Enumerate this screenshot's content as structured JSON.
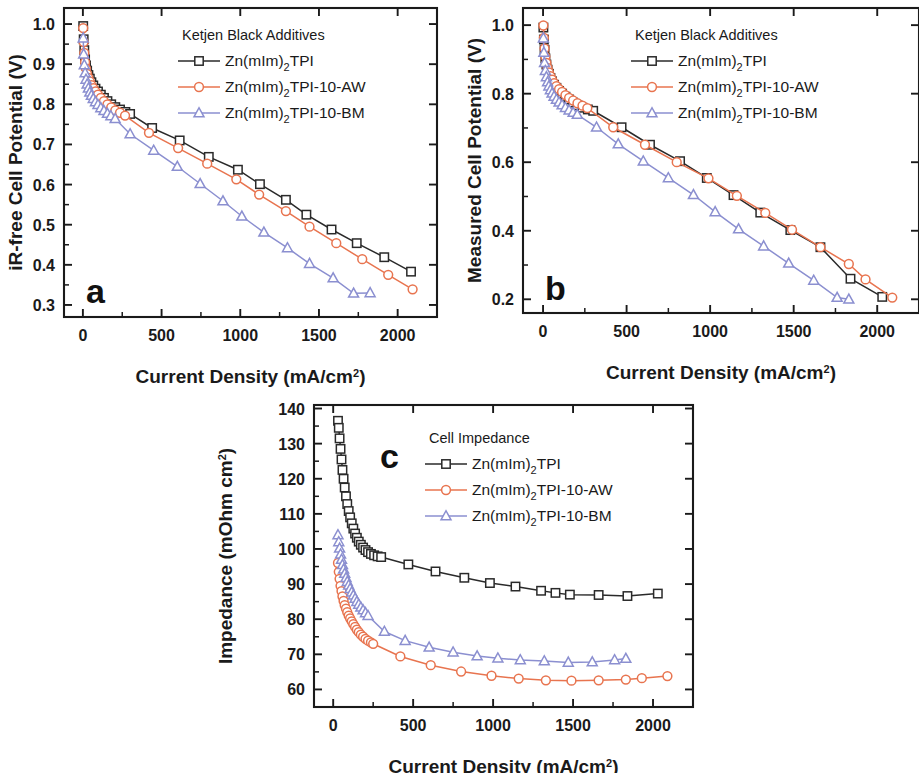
{
  "figure": {
    "panels": [
      "a",
      "b",
      "c"
    ],
    "colors": {
      "series1": "#2a2a2a",
      "series2": "#e8744f",
      "series3": "#8b8fd0",
      "axis": "#1a1a1a"
    }
  },
  "series_names": {
    "s1_pre": "Zn(mIm)",
    "s1_sub": "2",
    "s1_post": "TPI",
    "s2_post": "TPI-10-AW",
    "s3_post": "TPI-10-BM"
  },
  "axis_titles": {
    "current_density_pre": "Current Density (mA/cm",
    "current_density_sup": "2",
    "current_density_post": ")",
    "panel_a_y": "iR-free Cell Potential (V)",
    "panel_b_y": "Measured Cell Potential (V)",
    "panel_c_y_pre": "Impedance (mOhm cm",
    "panel_c_y_sup": "2",
    "panel_c_y_post": ")"
  },
  "legend_titles": {
    "panel_a": "Ketjen Black Additives",
    "panel_b": "Ketjen Black Additives",
    "panel_c": "Cell Impedance"
  },
  "panel_labels": {
    "a": "a",
    "b": "b",
    "c": "c"
  },
  "chart_data": [
    {
      "id": "a",
      "type": "line",
      "title": "",
      "xlabel": "Current Density (mA/cm2)",
      "ylabel": "iR-free Cell Potential (V)",
      "legend_title": "Ketjen Black Additives",
      "legend_position": "top-right",
      "grid": false,
      "xlim": [
        -120,
        2250
      ],
      "ylim": [
        0.27,
        1.04
      ],
      "xticks": [
        0,
        500,
        1000,
        1500,
        2000
      ],
      "yticks": [
        0.3,
        0.4,
        0.5,
        0.6,
        0.7,
        0.8,
        0.9,
        1.0
      ],
      "xticklabels": [
        "0",
        "500",
        "1000",
        "1500",
        "2000"
      ],
      "yticklabels": [
        "0.3",
        "0.4",
        "0.5",
        "0.6",
        "0.7",
        "0.8",
        "0.9",
        "1.0"
      ],
      "series": [
        {
          "name": "Zn(mIm)2TPI",
          "marker": "square",
          "color": "#2a2a2a",
          "x": [
            2,
            5,
            9,
            14,
            20,
            27,
            35,
            44,
            54,
            66,
            80,
            96,
            114,
            134,
            156,
            180,
            206,
            236,
            270,
            300,
            440,
            615,
            800,
            985,
            1125,
            1290,
            1420,
            1580,
            1740,
            1915,
            2085
          ],
          "y": [
            0.995,
            0.962,
            0.935,
            0.912,
            0.897,
            0.884,
            0.873,
            0.864,
            0.855,
            0.847,
            0.839,
            0.832,
            0.824,
            0.816,
            0.808,
            0.8,
            0.793,
            0.787,
            0.781,
            0.776,
            0.741,
            0.71,
            0.669,
            0.637,
            0.601,
            0.562,
            0.525,
            0.488,
            0.454,
            0.419,
            0.383
          ]
        },
        {
          "name": "Zn(mIm)2TPI-10-AW",
          "marker": "circle",
          "color": "#e8744f",
          "x": [
            2,
            5,
            9,
            14,
            20,
            27,
            35,
            44,
            54,
            66,
            80,
            96,
            114,
            134,
            156,
            180,
            206,
            236,
            268,
            420,
            605,
            790,
            975,
            1120,
            1290,
            1440,
            1610,
            1775,
            1940,
            2095
          ],
          "y": [
            0.99,
            0.955,
            0.928,
            0.905,
            0.889,
            0.876,
            0.866,
            0.857,
            0.848,
            0.84,
            0.832,
            0.824,
            0.816,
            0.808,
            0.8,
            0.792,
            0.785,
            0.779,
            0.772,
            0.729,
            0.691,
            0.652,
            0.613,
            0.575,
            0.534,
            0.495,
            0.454,
            0.414,
            0.375,
            0.339
          ]
        },
        {
          "name": "Zn(mIm)2TPI-10-BM",
          "marker": "triangle",
          "color": "#8b8fd0",
          "x": [
            2,
            5,
            9,
            14,
            20,
            27,
            35,
            44,
            54,
            66,
            80,
            96,
            114,
            134,
            156,
            178,
            205,
            300,
            450,
            600,
            745,
            890,
            1010,
            1150,
            1300,
            1440,
            1590,
            1720,
            1825
          ],
          "y": [
            0.965,
            0.925,
            0.898,
            0.878,
            0.862,
            0.85,
            0.84,
            0.83,
            0.822,
            0.814,
            0.806,
            0.799,
            0.791,
            0.784,
            0.777,
            0.771,
            0.764,
            0.726,
            0.685,
            0.645,
            0.602,
            0.559,
            0.521,
            0.481,
            0.442,
            0.403,
            0.367,
            0.329,
            0.33
          ]
        }
      ]
    },
    {
      "id": "b",
      "type": "line",
      "title": "",
      "xlabel": "Current Density (mA/cm2)",
      "ylabel": "Measured Cell Potential (V)",
      "legend_title": "Ketjen Black Additives",
      "legend_position": "top-right",
      "grid": false,
      "xlim": [
        -120,
        2250
      ],
      "ylim": [
        0.16,
        1.05
      ],
      "xticks": [
        0,
        500,
        1000,
        1500,
        2000
      ],
      "yticks": [
        0.2,
        0.4,
        0.6,
        0.8,
        1.0
      ],
      "xticklabels": [
        "0",
        "500",
        "1000",
        "1500",
        "2000"
      ],
      "yticklabels": [
        "0.2",
        "0.4",
        "0.6",
        "0.8",
        "1.0"
      ],
      "series": [
        {
          "name": "Zn(mIm)2TPI",
          "marker": "square",
          "color": "#2a2a2a",
          "x": [
            2,
            5,
            9,
            14,
            20,
            27,
            35,
            44,
            54,
            66,
            80,
            96,
            114,
            134,
            156,
            180,
            206,
            236,
            268,
            300,
            470,
            640,
            820,
            980,
            1140,
            1300,
            1480,
            1660,
            1840,
            2030
          ],
          "y": [
            0.993,
            0.958,
            0.928,
            0.903,
            0.885,
            0.87,
            0.858,
            0.846,
            0.836,
            0.826,
            0.817,
            0.808,
            0.8,
            0.791,
            0.783,
            0.774,
            0.766,
            0.759,
            0.754,
            0.75,
            0.702,
            0.651,
            0.603,
            0.554,
            0.504,
            0.453,
            0.402,
            0.352,
            0.26,
            0.207
          ]
        },
        {
          "name": "Zn(mIm)2TPI-10-AW",
          "marker": "circle",
          "color": "#e8744f",
          "x": [
            2,
            5,
            9,
            14,
            20,
            27,
            35,
            44,
            54,
            66,
            80,
            96,
            114,
            134,
            156,
            180,
            206,
            236,
            265,
            420,
            610,
            800,
            990,
            1160,
            1330,
            1490,
            1660,
            1830,
            1930,
            2090
          ],
          "y": [
            0.999,
            0.963,
            0.932,
            0.908,
            0.89,
            0.875,
            0.862,
            0.851,
            0.841,
            0.831,
            0.822,
            0.813,
            0.805,
            0.796,
            0.788,
            0.78,
            0.772,
            0.765,
            0.758,
            0.702,
            0.651,
            0.6,
            0.553,
            0.502,
            0.452,
            0.403,
            0.352,
            0.303,
            0.258,
            0.205
          ]
        },
        {
          "name": "Zn(mIm)2TPI-10-BM",
          "marker": "triangle",
          "color": "#8b8fd0",
          "x": [
            2,
            5,
            9,
            14,
            20,
            27,
            35,
            44,
            54,
            66,
            80,
            96,
            114,
            134,
            156,
            180,
            205,
            320,
            450,
            600,
            750,
            900,
            1030,
            1170,
            1320,
            1470,
            1620,
            1760,
            1830
          ],
          "y": [
            0.962,
            0.92,
            0.89,
            0.867,
            0.849,
            0.834,
            0.822,
            0.811,
            0.801,
            0.792,
            0.783,
            0.775,
            0.767,
            0.759,
            0.752,
            0.745,
            0.739,
            0.702,
            0.653,
            0.603,
            0.554,
            0.505,
            0.455,
            0.405,
            0.355,
            0.305,
            0.255,
            0.205,
            0.2
          ]
        }
      ]
    },
    {
      "id": "c",
      "type": "line",
      "title": "",
      "xlabel": "Current Density (mA/cm2)",
      "ylabel": "Impedance (mOhm cm2)",
      "legend_title": "Cell Impedance",
      "legend_position": "top-right",
      "grid": false,
      "xlim": [
        -120,
        2250
      ],
      "ylim": [
        55,
        141
      ],
      "xticks": [
        0,
        500,
        1000,
        1500,
        2000
      ],
      "yticks": [
        60,
        70,
        80,
        90,
        100,
        110,
        120,
        130,
        140
      ],
      "xticklabels": [
        "0",
        "500",
        "1000",
        "1500",
        "2000"
      ],
      "yticklabels": [
        "60",
        "70",
        "80",
        "90",
        "100",
        "110",
        "120",
        "130",
        "140"
      ],
      "series": [
        {
          "name": "Zn(mIm)2TPI",
          "marker": "square",
          "color": "#2a2a2a",
          "x": [
            30,
            35,
            40,
            46,
            52,
            58,
            65,
            72,
            80,
            88,
            97,
            106,
            116,
            126,
            137,
            148,
            160,
            173,
            187,
            202,
            218,
            236,
            256,
            278,
            300,
            470,
            640,
            820,
            980,
            1140,
            1300,
            1390,
            1480,
            1660,
            1840,
            2030
          ],
          "y": [
            136.5,
            134.5,
            131.5,
            128.5,
            125.5,
            122.5,
            120.0,
            117.5,
            115.0,
            112.8,
            110.8,
            109.0,
            107.3,
            105.8,
            104.4,
            103.2,
            102.1,
            101.2,
            100.4,
            99.7,
            99.1,
            98.6,
            98.2,
            97.9,
            97.7,
            95.6,
            93.6,
            91.8,
            90.3,
            89.3,
            88.1,
            87.5,
            87.0,
            86.9,
            86.6,
            87.3
          ]
        },
        {
          "name": "Zn(mIm)2TPI-10-AW",
          "marker": "circle",
          "color": "#e8744f",
          "x": [
            30,
            35,
            40,
            46,
            52,
            58,
            65,
            72,
            80,
            88,
            97,
            106,
            116,
            126,
            137,
            148,
            160,
            173,
            187,
            202,
            218,
            236,
            250,
            420,
            610,
            800,
            990,
            1160,
            1330,
            1490,
            1660,
            1830,
            1930,
            2090
          ],
          "y": [
            96.0,
            93.5,
            91.5,
            89.5,
            88.0,
            86.5,
            85.2,
            84.0,
            83.0,
            82.0,
            81.0,
            80.2,
            79.4,
            78.6,
            77.8,
            77.0,
            76.3,
            75.6,
            75.0,
            74.4,
            73.9,
            73.4,
            73.0,
            69.4,
            66.9,
            65.1,
            63.9,
            63.1,
            62.6,
            62.5,
            62.6,
            62.8,
            63.2,
            63.8
          ]
        },
        {
          "name": "Zn(mIm)2TPI-10-BM",
          "marker": "triangle",
          "color": "#8b8fd0",
          "x": [
            30,
            35,
            40,
            46,
            52,
            58,
            65,
            72,
            80,
            88,
            97,
            106,
            116,
            126,
            137,
            148,
            160,
            173,
            187,
            202,
            218,
            320,
            450,
            600,
            750,
            900,
            1030,
            1170,
            1320,
            1470,
            1620,
            1760,
            1830
          ],
          "y": [
            104.0,
            102.0,
            100.2,
            98.5,
            97.0,
            95.5,
            94.2,
            93.0,
            91.8,
            90.7,
            89.7,
            88.7,
            87.7,
            86.8,
            85.9,
            85.0,
            84.2,
            83.4,
            82.6,
            81.8,
            81.0,
            76.5,
            73.9,
            72.0,
            70.6,
            69.5,
            68.9,
            68.4,
            68.1,
            67.7,
            67.8,
            68.4,
            68.8
          ]
        }
      ]
    }
  ]
}
